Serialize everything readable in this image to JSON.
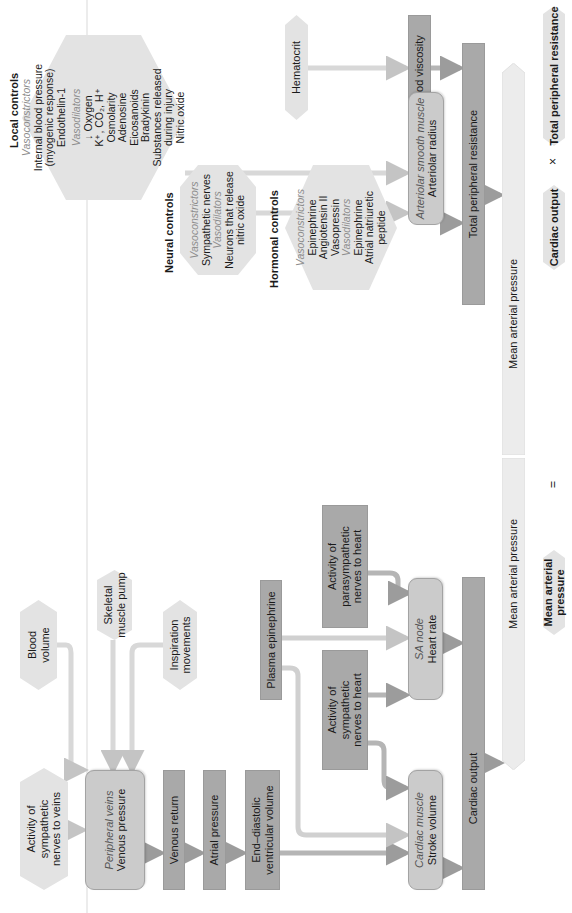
{
  "diagram": {
    "colors": {
      "hexagon_fill": "#e3e3e3",
      "dark_box_fill": "#a9a9a9",
      "rounded_box_fill": "#cbcbcb",
      "arrow_column_fill": "#ececec",
      "connector": "#d6d6d6",
      "italic_label": "#8c8c8c"
    },
    "local_controls": {
      "heading": "Local controls",
      "vasoconstrictors_label": "Vasoconstrictors",
      "vasoconstrictors": [
        "Internal blood pressure",
        "(myogenic response)",
        "Endothelin-1"
      ],
      "vasodilators_label": "Vasodilators",
      "vasodilators": [
        "↓ Oxygen",
        "K⁺, CO₂, H⁺",
        "Osmolarity",
        "Adenosine",
        "Eicosanoids",
        "Bradykinin",
        "Substances released",
        "during injury",
        "Nitric oxide"
      ]
    },
    "neural_controls": {
      "heading": "Neural controls",
      "vasoconstrictors_label": "Vasoconstrictors",
      "vasoconstrictors": [
        "Sympathetic nerves"
      ],
      "vasodilators_label": "Vasodilators",
      "vasodilators": [
        "Neurons that release",
        "nitric oxide"
      ]
    },
    "hormonal_controls": {
      "heading": "Hormonal controls",
      "vasoconstrictors_label": "Vasoconstrictors",
      "vasoconstrictors": [
        "Epinephrine",
        "Angiotensin II",
        "Vasopressin"
      ],
      "vasodilators_label": "Vasodilators",
      "vasodilators": [
        "Epinephrine",
        "Atrial natriuretic",
        "peptide"
      ]
    },
    "hematocrit": "Hematocrit",
    "blood_viscosity": "Blood viscosity",
    "arteriolar": {
      "italic": "Arteriolar smooth muscle",
      "label": "Arteriolar radius"
    },
    "total_peripheral_resistance": "Total peripheral resistance",
    "mean_arterial_pressure_column": [
      "Mean arterial pressure",
      "Mean arterial pressure"
    ],
    "blood_volume": [
      "Blood",
      "volume"
    ],
    "skeletal_muscle_pump": [
      "Skeletal",
      "muscle pump"
    ],
    "inspiration_movements": [
      "Inspiration",
      "movements"
    ],
    "sympathetic_to_veins": [
      "Activity of",
      "sympathetic",
      "nerves to veins"
    ],
    "peripheral_veins": {
      "italic": "Peripheral veins",
      "label": "Venous pressure"
    },
    "venous_return": "Venous return",
    "atrial_pressure": "Atrial pressure",
    "end_diastolic": [
      "End–diastolic",
      "ventricular volume"
    ],
    "plasma_epinephrine": "Plasma epinephrine",
    "sympathetic_to_heart": [
      "Activity of",
      "sympathetic",
      "nerves to heart"
    ],
    "parasympathetic_to_heart": [
      "Activity of",
      "parasympathetic",
      "nerves to heart"
    ],
    "sa_node": {
      "italic": "SA node",
      "label": "Heart rate"
    },
    "cardiac_muscle": {
      "italic": "Cardiac muscle",
      "label": "Stroke volume"
    },
    "cardiac_output_box": "Cardiac output",
    "formula": {
      "lhs": "Mean arterial pressure",
      "equals": "=",
      "term1": "Cardiac output",
      "times": "×",
      "term2": "Total peripheral resistance"
    }
  }
}
